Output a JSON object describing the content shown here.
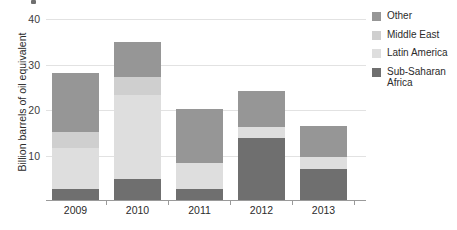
{
  "chart_data": {
    "type": "bar",
    "stacked": true,
    "title": "",
    "subtitle": "",
    "xlabel": "",
    "ylabel": "Billion barrels of oil equivalent",
    "categories": [
      "2009",
      "2010",
      "2011",
      "2012",
      "2013"
    ],
    "ylim": [
      0,
      42.5
    ],
    "yticks": [
      10,
      20,
      30,
      40
    ],
    "ytick_labels": [
      "10",
      "20",
      "30",
      "40"
    ],
    "grid": true,
    "legend_position": "right",
    "series": [
      {
        "name": "Sub-Saharan Africa",
        "color": "#6f6f6f",
        "values": [
          2.4,
          4.6,
          2.4,
          13.6,
          6.8
        ]
      },
      {
        "name": "Latin America",
        "color": "#dedede",
        "values": [
          9.0,
          18.5,
          5.7,
          2.4,
          2.6
        ]
      },
      {
        "name": "Middle East",
        "color": "#cfcfcf",
        "values": [
          3.5,
          4.0,
          0.0,
          0.0,
          0.0
        ]
      },
      {
        "name": "Other",
        "color": "#969696",
        "values": [
          13.0,
          7.7,
          11.9,
          8.1,
          6.8
        ]
      }
    ],
    "totals": [
      27.9,
      34.8,
      20.0,
      24.1,
      16.2
    ]
  },
  "legend": {
    "entries": [
      {
        "label": "Other",
        "color": "#969696"
      },
      {
        "label": "Middle East",
        "color": "#cfcfcf"
      },
      {
        "label": "Latin America",
        "color": "#dedede"
      },
      {
        "label": "Sub-Saharan Africa",
        "color": "#6f6f6f"
      }
    ]
  },
  "axis": {
    "y_label": "Billion barrels of oil equivalent",
    "y_ticks": [
      "10",
      "20",
      "30",
      "40"
    ],
    "x_ticks": [
      "2009",
      "2010",
      "2011",
      "2012",
      "2013"
    ]
  }
}
